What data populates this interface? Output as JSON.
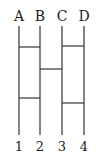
{
  "diagram": {
    "type": "ladder-lottery",
    "top_labels": [
      "A",
      "B",
      "C",
      "D"
    ],
    "bottom_labels": [
      "1",
      "2",
      "3",
      "4"
    ],
    "rungs": [
      {
        "from": "A",
        "to": "B",
        "order": 1
      },
      {
        "from": "C",
        "to": "D",
        "order": 1
      },
      {
        "from": "B",
        "to": "C",
        "order": 2
      },
      {
        "from": "A",
        "to": "B",
        "order": 3
      },
      {
        "from": "C",
        "to": "D",
        "order": 4
      }
    ],
    "line_color": "#333333",
    "text_color": "#222222"
  }
}
